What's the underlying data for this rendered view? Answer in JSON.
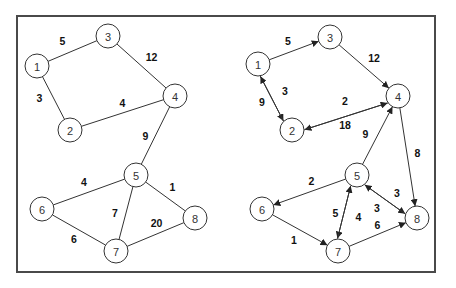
{
  "graphs": [
    {
      "name": "undirected-graph",
      "directed": false,
      "nodes": [
        {
          "id": "1",
          "label": "1"
        },
        {
          "id": "2",
          "label": "2"
        },
        {
          "id": "3",
          "label": "3"
        },
        {
          "id": "4",
          "label": "4"
        },
        {
          "id": "5",
          "label": "5"
        },
        {
          "id": "6",
          "label": "6"
        },
        {
          "id": "7",
          "label": "7"
        },
        {
          "id": "8",
          "label": "8"
        }
      ],
      "edges": [
        {
          "from": "1",
          "to": "3",
          "weight": "5"
        },
        {
          "from": "1",
          "to": "2",
          "weight": "3"
        },
        {
          "from": "3",
          "to": "4",
          "weight": "12"
        },
        {
          "from": "2",
          "to": "4",
          "weight": "4"
        },
        {
          "from": "4",
          "to": "5",
          "weight": "9"
        },
        {
          "from": "5",
          "to": "6",
          "weight": "4"
        },
        {
          "from": "5",
          "to": "8",
          "weight": "1"
        },
        {
          "from": "5",
          "to": "7",
          "weight": "7"
        },
        {
          "from": "6",
          "to": "7",
          "weight": "6"
        },
        {
          "from": "7",
          "to": "8",
          "weight": "20"
        }
      ]
    },
    {
      "name": "directed-graph",
      "directed": true,
      "nodes": [
        {
          "id": "1",
          "label": "1"
        },
        {
          "id": "2",
          "label": "2"
        },
        {
          "id": "3",
          "label": "3"
        },
        {
          "id": "4",
          "label": "4"
        },
        {
          "id": "5",
          "label": "5"
        },
        {
          "id": "6",
          "label": "6"
        },
        {
          "id": "7",
          "label": "7"
        },
        {
          "id": "8",
          "label": "8"
        }
      ],
      "edges": [
        {
          "from": "1",
          "to": "3",
          "weight": "5"
        },
        {
          "from": "1",
          "to": "2",
          "weight": "9"
        },
        {
          "from": "2",
          "to": "1",
          "weight": "3"
        },
        {
          "from": "3",
          "to": "4",
          "weight": "12"
        },
        {
          "from": "4",
          "to": "2",
          "weight": "2"
        },
        {
          "from": "2",
          "to": "4",
          "weight": "18"
        },
        {
          "from": "5",
          "to": "4",
          "weight": "9"
        },
        {
          "from": "4",
          "to": "8",
          "weight": "8"
        },
        {
          "from": "5",
          "to": "6",
          "weight": "2"
        },
        {
          "from": "6",
          "to": "7",
          "weight": "1"
        },
        {
          "from": "5",
          "to": "7",
          "weight": "5"
        },
        {
          "from": "7",
          "to": "5",
          "weight": "4"
        },
        {
          "from": "5",
          "to": "8",
          "weight": "3"
        },
        {
          "from": "8",
          "to": "5",
          "weight": "3"
        },
        {
          "from": "7",
          "to": "8",
          "weight": "6"
        }
      ]
    }
  ]
}
